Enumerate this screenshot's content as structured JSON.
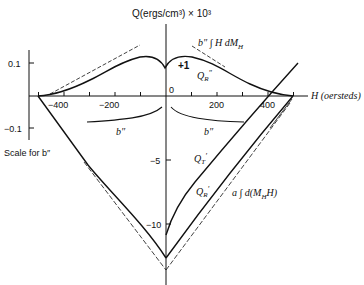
{
  "diagram": {
    "y_axis_title": "Q(ergs/cm³) × 10³",
    "x_axis_title": "H (oersteds)",
    "b_scale_caption": "Scale for b″",
    "x_ticks": [
      {
        "value": -500,
        "label": ""
      },
      {
        "value": -400,
        "label": "−400"
      },
      {
        "value": -300,
        "label": ""
      },
      {
        "value": -200,
        "label": "−200"
      },
      {
        "value": -100,
        "label": ""
      },
      {
        "value": 0,
        "label": "0"
      },
      {
        "value": 100,
        "label": ""
      },
      {
        "value": 200,
        "label": "200"
      },
      {
        "value": 300,
        "label": ""
      },
      {
        "value": 400,
        "label": "400"
      },
      {
        "value": 500,
        "label": ""
      }
    ],
    "main_y_ticks": [
      {
        "value": -5,
        "label": "−5"
      },
      {
        "value": -10,
        "label": "−10"
      }
    ],
    "b_scale_ticks": [
      {
        "value": 0.1,
        "label": "0.1"
      },
      {
        "value": -0.1,
        "label": "−0.1"
      }
    ],
    "annotations": {
      "b_integral": "b″ ∫ H dM",
      "b_integral_sub": "H",
      "plus_one": "+1",
      "qr_double": "Q",
      "qr_double_sub": "R",
      "qr_double_sup": "″",
      "b_left": "b″",
      "b_right": "b″",
      "qt_prime": "Q",
      "qt_prime_sub": "T",
      "qt_prime_sup": "′",
      "qr_prime": "Q",
      "qr_prime_sub": "R",
      "qr_prime_sup": "′",
      "a_integral": "a ∫ d(M",
      "a_integral_sub": "H",
      "a_integral_tail": "H)"
    },
    "curves": [
      {
        "name": "Q_R'' (upper, b'' scale)",
        "style": "solid",
        "points": [
          [
            -510,
            0
          ],
          [
            -400,
            0.012
          ],
          [
            -300,
            0.05
          ],
          [
            -200,
            0.1
          ],
          [
            -100,
            0.118
          ],
          [
            -20,
            0.1
          ],
          [
            0,
            0.08
          ],
          [
            20,
            0.1
          ],
          [
            100,
            0.118
          ],
          [
            200,
            0.09
          ],
          [
            300,
            0.05
          ],
          [
            400,
            0.015
          ],
          [
            510,
            0
          ]
        ]
      },
      {
        "name": "b'' ∫ H dM_H tangents",
        "style": "dashed"
      },
      {
        "name": "b'' lower branches",
        "style": "solid"
      },
      {
        "name": "Q_R'",
        "style": "solid",
        "vertex_value": -12.7
      },
      {
        "name": "Q_T'",
        "style": "solid",
        "start_value": -10.9
      },
      {
        "name": "a ∫ d(M_H H)",
        "style": "dashed",
        "vertex_value": -13.6
      }
    ]
  }
}
